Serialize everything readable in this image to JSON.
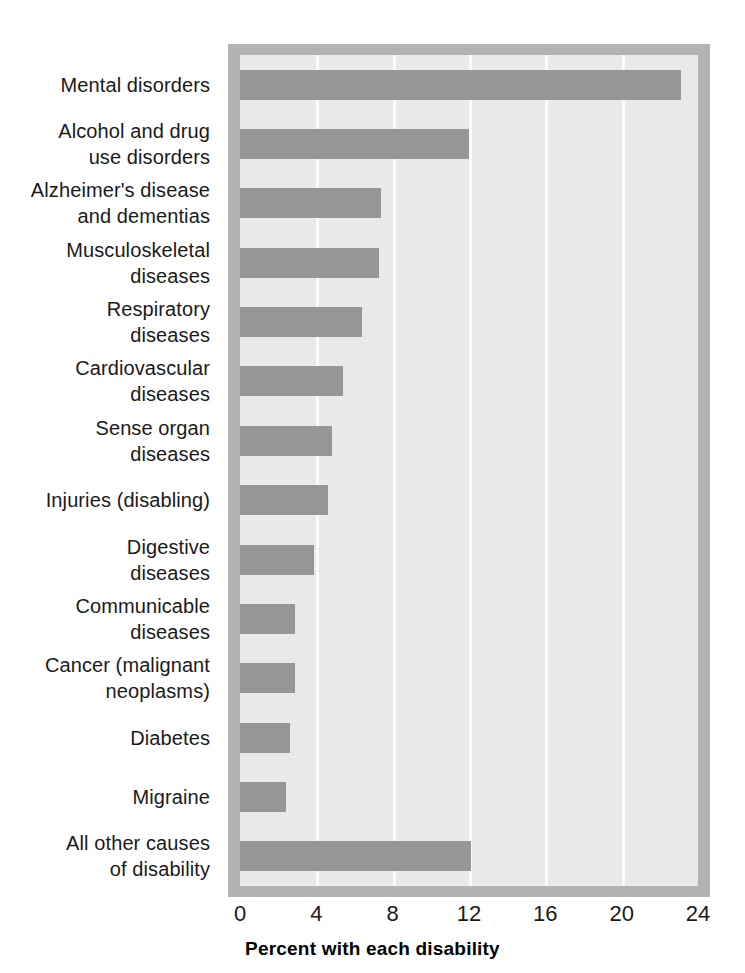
{
  "chart_data": {
    "type": "bar",
    "orientation": "horizontal",
    "title": "",
    "xlabel": "Percent with each disability",
    "ylabel": "",
    "xlim": [
      0,
      24
    ],
    "xticks": [
      0,
      4,
      8,
      12,
      16,
      20,
      24
    ],
    "xtick_labels": [
      "0",
      "4",
      "8",
      "12",
      "16",
      "20",
      "24"
    ],
    "grid": "vertical-white-gridlines",
    "legend": "none",
    "bar_color": "#969696",
    "plot_background": "#e9e9e9",
    "frame_color": "#b3b3b3",
    "categories": [
      "Mental disorders",
      "Alcohol and drug use disorders",
      "Alzheimer's disease and dementias",
      "Musculoskeletal diseases",
      "Respiratory diseases",
      "Cardiovascular diseases",
      "Sense organ diseases",
      "Injuries (disabling)",
      "Digestive diseases",
      "Communicable diseases",
      "Cancer (malignant neoplasms)",
      "Diabetes",
      "Migraine",
      "All other causes of disability"
    ],
    "category_label_lines": [
      [
        "Mental disorders"
      ],
      [
        "Alcohol and drug",
        "use disorders"
      ],
      [
        "Alzheimer's disease",
        "and dementias"
      ],
      [
        "Musculoskeletal",
        "diseases"
      ],
      [
        "Respiratory",
        "diseases"
      ],
      [
        "Cardiovascular",
        "diseases"
      ],
      [
        "Sense organ",
        "diseases"
      ],
      [
        "Injuries (disabling)"
      ],
      [
        "Digestive",
        "diseases"
      ],
      [
        "Communicable",
        "diseases"
      ],
      [
        "Cancer (malignant",
        "neoplasms)"
      ],
      [
        "Diabetes"
      ],
      [
        "Migraine"
      ],
      [
        "All other causes",
        "of disability"
      ]
    ],
    "values": [
      23.1,
      12.0,
      7.4,
      7.3,
      6.4,
      5.4,
      4.8,
      4.6,
      3.9,
      2.9,
      2.9,
      2.6,
      2.4,
      12.1
    ]
  },
  "axis": {
    "title": "Percent with each disability"
  }
}
